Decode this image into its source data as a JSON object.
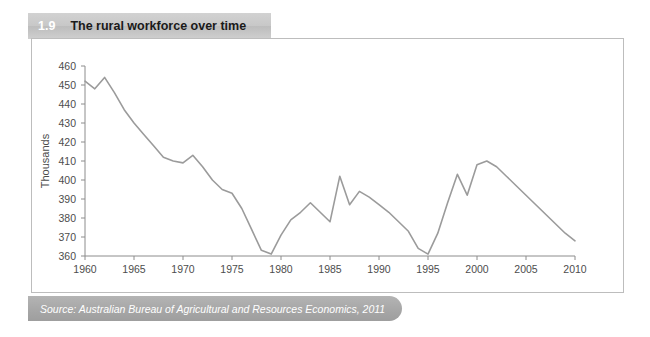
{
  "figure": {
    "number": "1.9",
    "title": "The rural workforce over time",
    "source": "Source: Australian Bureau of Agricultural and Resources Economics, 2011"
  },
  "colors": {
    "title_bar": "#c8c8c8",
    "source_bar": "#a8a8a8",
    "line": "#9b9b9b",
    "axis": "#8c8c8c",
    "frame": "#bdbdbd",
    "text": "#4d4d4d"
  },
  "chart_data": {
    "type": "line",
    "title": "The rural workforce over time",
    "xlabel": "",
    "ylabel": "Thousands",
    "xlim": [
      1960,
      2010
    ],
    "ylim": [
      360,
      460
    ],
    "grid": false,
    "legend": null,
    "xticks": [
      1960,
      1965,
      1970,
      1975,
      1980,
      1985,
      1990,
      1995,
      2000,
      2005,
      2010
    ],
    "yticks": [
      360,
      370,
      380,
      390,
      400,
      410,
      420,
      430,
      440,
      450,
      460
    ],
    "series": [
      {
        "name": "Rural workforce",
        "x": [
          1960,
          1961,
          1962,
          1963,
          1964,
          1965,
          1966,
          1967,
          1968,
          1969,
          1970,
          1971,
          1972,
          1973,
          1974,
          1975,
          1976,
          1977,
          1978,
          1979,
          1980,
          1981,
          1982,
          1983,
          1984,
          1985,
          1986,
          1987,
          1988,
          1989,
          1990,
          1991,
          1992,
          1993,
          1994,
          1995,
          1996,
          1997,
          1998,
          1999,
          2000,
          2001,
          2002,
          2003,
          2004,
          2005,
          2006,
          2007,
          2008,
          2009,
          2010
        ],
        "values": [
          452,
          448,
          454,
          446,
          437,
          430,
          424,
          418,
          412,
          410,
          409,
          413,
          407,
          400,
          395,
          393,
          385,
          374,
          363,
          361,
          371,
          379,
          383,
          388,
          383,
          378,
          402,
          387,
          394,
          391,
          387,
          383,
          378,
          373,
          364,
          361,
          372,
          388,
          403,
          392,
          408,
          410,
          407,
          402,
          397,
          392,
          387,
          382,
          377,
          372,
          368
        ]
      }
    ]
  }
}
